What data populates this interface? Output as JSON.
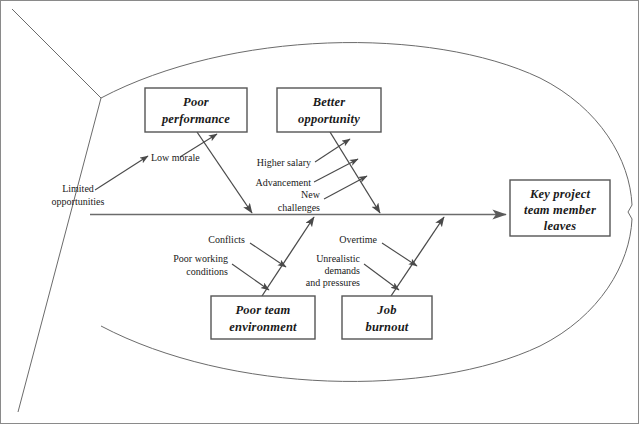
{
  "diagram": {
    "type": "fishbone-ishikawa",
    "title_effect": "Key project team member leaves",
    "effect_box": {
      "lines": [
        "Key project",
        "team member",
        "leaves"
      ]
    },
    "categories": [
      {
        "id": "poor-performance",
        "lines": [
          "Poor",
          "performance"
        ],
        "position": "upper-left",
        "causes": [
          {
            "id": "low-morale",
            "lines": [
              "Low morale"
            ]
          },
          {
            "id": "limited-opportunities",
            "lines": [
              "Limited",
              "opportunities"
            ]
          }
        ]
      },
      {
        "id": "better-opportunity",
        "lines": [
          "Better",
          "opportunity"
        ],
        "position": "upper-right",
        "causes": [
          {
            "id": "higher-salary",
            "lines": [
              "Higher salary"
            ]
          },
          {
            "id": "advancement",
            "lines": [
              "Advancement"
            ]
          },
          {
            "id": "new-challenges",
            "lines": [
              "New",
              "challenges"
            ]
          }
        ]
      },
      {
        "id": "poor-team-environment",
        "lines": [
          "Poor team",
          "environment"
        ],
        "position": "lower-left",
        "causes": [
          {
            "id": "conflicts",
            "lines": [
              "Conflicts"
            ]
          },
          {
            "id": "poor-working-conditions",
            "lines": [
              "Poor working",
              "conditions"
            ]
          }
        ]
      },
      {
        "id": "job-burnout",
        "lines": [
          "Job",
          "burnout"
        ],
        "position": "lower-right",
        "causes": [
          {
            "id": "overtime",
            "lines": [
              "Overtime"
            ]
          },
          {
            "id": "unrealistic-demands",
            "lines": [
              "Unrealistic",
              "demands",
              "and pressures"
            ]
          }
        ]
      }
    ],
    "colors": {
      "outline": "#6b6b6b",
      "spine": "#6b6b6b",
      "bone": "#4a4a4a",
      "box_border": "#555555",
      "text": "#1a1a1a",
      "background": "#ffffff",
      "frame": "#8a8a8a"
    }
  }
}
